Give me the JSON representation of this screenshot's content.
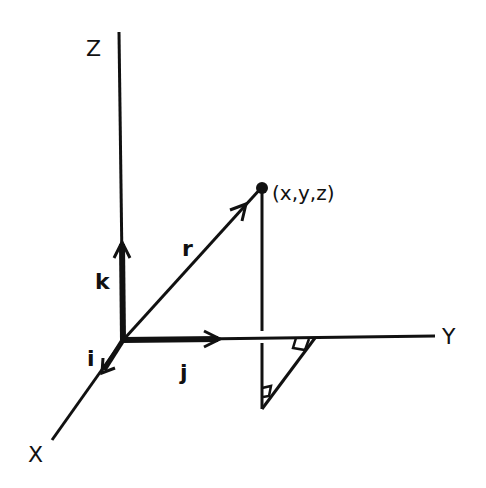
{
  "diagram": {
    "axes": [
      {
        "name": "Z",
        "label": "Z"
      },
      {
        "name": "Y",
        "label": "Y"
      },
      {
        "name": "X",
        "label": "X"
      }
    ],
    "unit_vectors": [
      {
        "name": "i",
        "label": "i",
        "axis": "X"
      },
      {
        "name": "j",
        "label": "j",
        "axis": "Y"
      },
      {
        "name": "k",
        "label": "k",
        "axis": "Z"
      }
    ],
    "position_vector": {
      "label": "r"
    },
    "point": {
      "label": "(x,y,z)"
    },
    "colors": {
      "ink": "#111111",
      "background": "#ffffff"
    }
  }
}
